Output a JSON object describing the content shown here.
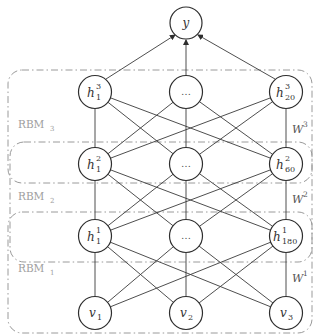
{
  "diagram": {
    "output_node": {
      "label": "y"
    },
    "layers": [
      {
        "name": "h3",
        "nodes": [
          {
            "base": "h",
            "sup": "3",
            "sub": "1"
          },
          {
            "dots": "…"
          },
          {
            "base": "h",
            "sup": "3",
            "sub": "20"
          }
        ]
      },
      {
        "name": "h2",
        "nodes": [
          {
            "base": "h",
            "sup": "2",
            "sub": "1"
          },
          {
            "dots": "…"
          },
          {
            "base": "h",
            "sup": "2",
            "sub": "60"
          }
        ]
      },
      {
        "name": "h1",
        "nodes": [
          {
            "base": "h",
            "sup": "1",
            "sub": "1"
          },
          {
            "dots": "…"
          },
          {
            "base": "h",
            "sup": "1",
            "sub": "180"
          }
        ]
      },
      {
        "name": "v",
        "nodes": [
          {
            "base": "v",
            "sub": "1"
          },
          {
            "base": "v",
            "sub": "2"
          },
          {
            "base": "v",
            "sub": "3"
          }
        ]
      }
    ],
    "rbms": [
      {
        "base": "RBM",
        "sub": "3"
      },
      {
        "base": "RBM",
        "sub": "2"
      },
      {
        "base": "RBM",
        "sub": "1"
      }
    ],
    "weights": [
      {
        "base": "W",
        "sup": "3"
      },
      {
        "base": "W",
        "sup": "2"
      },
      {
        "base": "W",
        "sup": "1"
      }
    ],
    "colors": {
      "edge": "#3a3a3a",
      "box": "#9a9a9a",
      "rbm_label": "#9e9e9e"
    }
  }
}
